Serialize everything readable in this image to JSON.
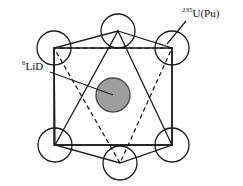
{
  "figure": {
    "background_color": "#ffffff",
    "line_color": "#1a1a1a",
    "center_fill_color": "#9e9e9e",
    "center_stroke_color": "#4d4d4d",
    "circle_fill_color": "#ffffff"
  },
  "labels": {
    "center": {
      "name": "lithium-6-deuteride",
      "superscript": "6",
      "text": "LiD",
      "full": "6LiD"
    },
    "vertex": {
      "name": "uranium-235-plutonium",
      "superscript": "235",
      "text": "U(Pu)",
      "full": "235U(Pu)"
    }
  },
  "geometry": {
    "hexagon_vertices": [
      {
        "id": "top",
        "cx": 118,
        "cy": 31,
        "r": 17
      },
      {
        "id": "upper-right",
        "cx": 172,
        "cy": 48,
        "r": 17
      },
      {
        "id": "lower-right",
        "cx": 172,
        "cy": 145,
        "r": 17
      },
      {
        "id": "bottom",
        "cx": 120,
        "cy": 163,
        "r": 17
      },
      {
        "id": "lower-left",
        "cx": 55,
        "cy": 145,
        "r": 17
      },
      {
        "id": "upper-left",
        "cx": 54,
        "cy": 48,
        "r": 17
      }
    ],
    "center_circle": {
      "cx": 113,
      "cy": 95,
      "r": 17
    },
    "rectangle": [
      {
        "x": 54,
        "y": 48
      },
      {
        "x": 172,
        "y": 48
      },
      {
        "x": 172,
        "y": 145
      },
      {
        "x": 54,
        "y": 145
      }
    ],
    "solid_triangle": [
      {
        "x": 118,
        "y": 31
      },
      {
        "x": 172,
        "y": 145
      },
      {
        "x": 55,
        "y": 145
      }
    ],
    "dashed_triangle": [
      {
        "x": 120,
        "y": 163
      },
      {
        "x": 54,
        "y": 48
      },
      {
        "x": 172,
        "y": 48
      }
    ],
    "hexagon_outline": [
      {
        "x": 118,
        "y": 31
      },
      {
        "x": 172,
        "y": 48
      },
      {
        "x": 172,
        "y": 145
      },
      {
        "x": 120,
        "y": 163
      },
      {
        "x": 55,
        "y": 145
      },
      {
        "x": 54,
        "y": 48
      }
    ],
    "leader_center": {
      "x1": 50,
      "y1": 72,
      "x2": 113,
      "y2": 95
    },
    "leader_vertex": {
      "x1": 186,
      "y1": 21,
      "x2": 167,
      "y2": 44
    }
  }
}
